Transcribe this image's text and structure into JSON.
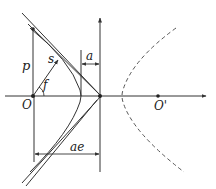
{
  "diagram": {
    "type": "hyperbola-geometry",
    "colors": {
      "stroke": "#333333",
      "dashed": "#555555",
      "background": "#ffffff"
    },
    "labels": {
      "p": "p",
      "s": "s",
      "f": "f",
      "a": "a",
      "O": "O",
      "O_prime": "O'",
      "ae": "ae"
    },
    "elements": [
      "horizontal-axis",
      "vertical-axis",
      "focus-O",
      "focus-O-prime",
      "hyperbola-branch-solid",
      "hyperbola-branch-dashed",
      "asymptote-pair",
      "vector-s",
      "angle-f",
      "dimension-a",
      "dimension-ae",
      "segment-p"
    ]
  }
}
